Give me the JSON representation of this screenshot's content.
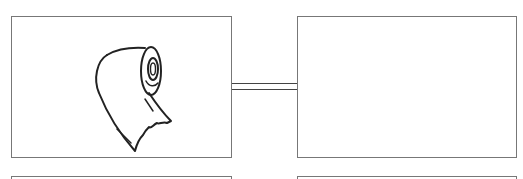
{
  "diagram": {
    "type": "storyboard-panels",
    "panels": [
      {
        "id": "top-left",
        "content": "toilet-paper-roll-illustration"
      },
      {
        "id": "top-right",
        "content": "empty"
      },
      {
        "id": "bottom-left",
        "content": "empty"
      },
      {
        "id": "bottom-right",
        "content": "empty"
      }
    ],
    "connector": {
      "from": "top-left",
      "to": "top-right",
      "style": "double-line"
    }
  },
  "colors": {
    "border": "#777777",
    "stroke": "#222222",
    "background": "#ffffff"
  }
}
